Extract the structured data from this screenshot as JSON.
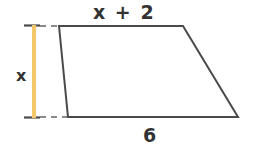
{
  "figure": {
    "shape_type": "trapezoid",
    "background_color": "#ffffff",
    "stroke_color": "#4a4a4a",
    "stroke_width": 2,
    "measure_color": "#f3c86b",
    "dash_color": "#808080",
    "label_color": "#333333",
    "vertices": [
      {
        "name": "top-left",
        "x": 59,
        "y": 26
      },
      {
        "name": "top-right",
        "x": 183,
        "y": 26
      },
      {
        "name": "bottom-right",
        "x": 238,
        "y": 117
      },
      {
        "name": "bottom-left",
        "x": 68,
        "y": 117
      }
    ],
    "labels": {
      "top_base": "x + 2",
      "bottom_base": "6",
      "height": "x"
    },
    "height_measure": {
      "x": 34,
      "y_top": 25,
      "y_bottom": 118,
      "cap_half_width": 6
    },
    "extension_lines": {
      "top": {
        "y": 26,
        "x_start": 24,
        "x_end": 59
      },
      "bottom": {
        "y": 117,
        "x_start": 24,
        "x_end": 68
      }
    }
  }
}
